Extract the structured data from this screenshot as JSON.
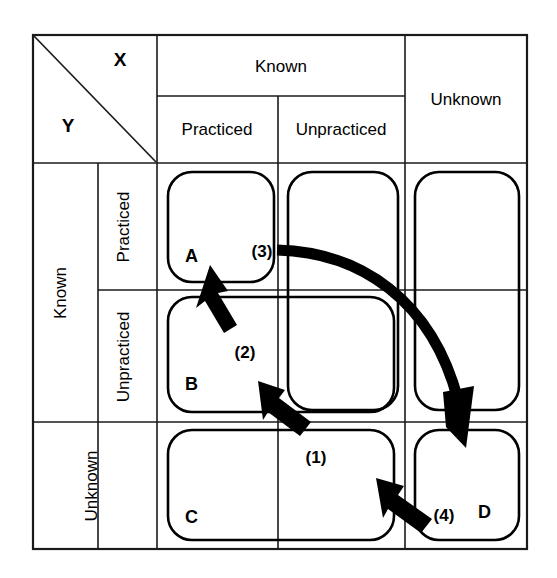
{
  "diagram": {
    "title_axes": {
      "x_axis_label": "X",
      "y_axis_label": "Y"
    },
    "column_headers": {
      "group_known": "Known",
      "sub_practiced": "Practiced",
      "sub_unpracticed": "Unpracticed",
      "group_unknown": "Unknown"
    },
    "row_headers": {
      "group_known": "Known",
      "sub_practiced": "Practiced",
      "sub_unpracticed": "Unpracticed",
      "group_unknown": "Unknown"
    },
    "cells": [
      {
        "id": "A",
        "label": "A",
        "row": "Known / Practiced",
        "column": "Known / Practiced"
      },
      {
        "id": "B",
        "label": "B",
        "row": "Known / Unpracticed",
        "column": "Known"
      },
      {
        "id": "C",
        "label": "C",
        "row": "Unknown",
        "column": "Known"
      },
      {
        "id": "D",
        "label": "D",
        "row": "Unknown",
        "column": "Unknown"
      }
    ],
    "transition_markers": [
      {
        "id": "1",
        "label": "(1)"
      },
      {
        "id": "2",
        "label": "(2)"
      },
      {
        "id": "3",
        "label": "(3)"
      },
      {
        "id": "4",
        "label": "(4)"
      }
    ],
    "colors": {
      "ink": "#000000",
      "grid": "#1a1a1a",
      "background": "#ffffff"
    }
  }
}
